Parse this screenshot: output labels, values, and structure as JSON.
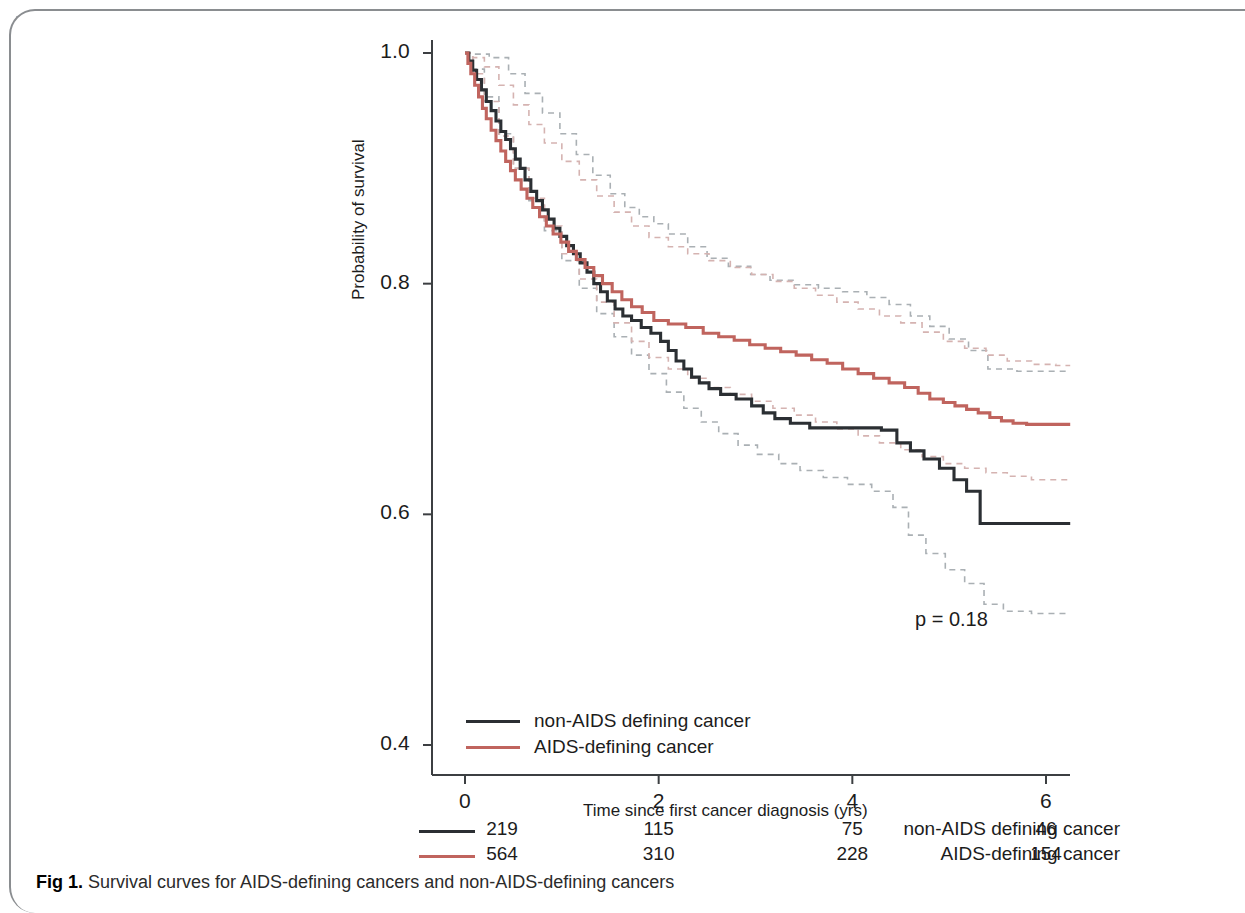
{
  "figure": {
    "caption_prefix": "Fig 1.",
    "caption_text": "Survival curves for AIDS-defining cancers and non-AIDS-defining cancers"
  },
  "annotations": {
    "pvalue": "p = 0.18"
  },
  "legend": {
    "position": "inside-bottom-left",
    "entries": [
      {
        "label": "non-AIDS defining cancer",
        "color": "#2b2f33"
      },
      {
        "label": "AIDS-defining cancer",
        "color": "#c0645e"
      }
    ]
  },
  "risk_table": {
    "time_header": [
      "0",
      "2",
      "4",
      "6"
    ],
    "rows": [
      {
        "label": "non-AIDS defining cancer",
        "color": "#2b2f33",
        "counts": [
          "219",
          "115",
          "75",
          "46"
        ]
      },
      {
        "label": "AIDS-defining cancer",
        "color": "#c0645e",
        "counts": [
          "564",
          "310",
          "228",
          "154"
        ]
      }
    ]
  },
  "chart_data": {
    "type": "line",
    "title": "",
    "xlabel": "Time since first cancer diagnosis (yrs)",
    "ylabel": "Probability of survival",
    "xlim": [
      0,
      6.35
    ],
    "ylim": [
      0.38,
      1.02
    ],
    "xticks": [
      0,
      2,
      4,
      6
    ],
    "xtick_labels": [
      "0",
      "2",
      "4",
      "6"
    ],
    "yticks": [
      0.4,
      0.6,
      0.8,
      1.0
    ],
    "ytick_labels": [
      "0.4",
      "0.6",
      "0.8",
      "1.0"
    ],
    "grid": false,
    "curve_style": "kaplan-meier step",
    "colors": {
      "non_aids": "#2b2f33",
      "aids": "#c0645e",
      "ci_non_aids": "#aab0b4",
      "ci_aids": "#d5b3b1"
    },
    "series": [
      {
        "name": "non-AIDS defining cancer",
        "color": "#2b2f33",
        "style": "solid",
        "points": [
          [
            0.0,
            1.0
          ],
          [
            0.04,
            0.993
          ],
          [
            0.08,
            0.985
          ],
          [
            0.12,
            0.977
          ],
          [
            0.17,
            0.968
          ],
          [
            0.22,
            0.958
          ],
          [
            0.27,
            0.95
          ],
          [
            0.32,
            0.941
          ],
          [
            0.37,
            0.932
          ],
          [
            0.42,
            0.925
          ],
          [
            0.47,
            0.917
          ],
          [
            0.52,
            0.908
          ],
          [
            0.57,
            0.9
          ],
          [
            0.62,
            0.89
          ],
          [
            0.68,
            0.88
          ],
          [
            0.74,
            0.872
          ],
          [
            0.8,
            0.864
          ],
          [
            0.86,
            0.856
          ],
          [
            0.92,
            0.848
          ],
          [
            0.98,
            0.841
          ],
          [
            1.05,
            0.833
          ],
          [
            1.12,
            0.826
          ],
          [
            1.19,
            0.818
          ],
          [
            1.26,
            0.81
          ],
          [
            1.33,
            0.8
          ],
          [
            1.4,
            0.793
          ],
          [
            1.47,
            0.785
          ],
          [
            1.55,
            0.778
          ],
          [
            1.63,
            0.772
          ],
          [
            1.72,
            0.768
          ],
          [
            1.82,
            0.762
          ],
          [
            1.92,
            0.757
          ],
          [
            2.02,
            0.75
          ],
          [
            2.1,
            0.742
          ],
          [
            2.18,
            0.733
          ],
          [
            2.26,
            0.726
          ],
          [
            2.34,
            0.719
          ],
          [
            2.42,
            0.714
          ],
          [
            2.52,
            0.709
          ],
          [
            2.64,
            0.704
          ],
          [
            2.8,
            0.7
          ],
          [
            2.96,
            0.694
          ],
          [
            3.08,
            0.688
          ],
          [
            3.2,
            0.683
          ],
          [
            3.36,
            0.679
          ],
          [
            3.56,
            0.675
          ],
          [
            3.8,
            0.675
          ],
          [
            4.05,
            0.675
          ],
          [
            4.3,
            0.673
          ],
          [
            4.46,
            0.662
          ],
          [
            4.6,
            0.655
          ],
          [
            4.74,
            0.648
          ],
          [
            4.9,
            0.64
          ],
          [
            5.05,
            0.63
          ],
          [
            5.18,
            0.62
          ],
          [
            5.32,
            0.592
          ],
          [
            5.6,
            0.592
          ],
          [
            6.0,
            0.592
          ],
          [
            6.25,
            0.592
          ]
        ]
      },
      {
        "name": "AIDS-defining cancer",
        "color": "#c0645e",
        "style": "solid",
        "points": [
          [
            0.0,
            1.0
          ],
          [
            0.03,
            0.991
          ],
          [
            0.06,
            0.982
          ],
          [
            0.1,
            0.972
          ],
          [
            0.14,
            0.962
          ],
          [
            0.18,
            0.952
          ],
          [
            0.22,
            0.943
          ],
          [
            0.27,
            0.933
          ],
          [
            0.32,
            0.924
          ],
          [
            0.37,
            0.915
          ],
          [
            0.42,
            0.906
          ],
          [
            0.47,
            0.898
          ],
          [
            0.52,
            0.89
          ],
          [
            0.58,
            0.882
          ],
          [
            0.64,
            0.874
          ],
          [
            0.7,
            0.866
          ],
          [
            0.77,
            0.858
          ],
          [
            0.84,
            0.85
          ],
          [
            0.91,
            0.843
          ],
          [
            0.99,
            0.836
          ],
          [
            1.07,
            0.828
          ],
          [
            1.15,
            0.821
          ],
          [
            1.24,
            0.814
          ],
          [
            1.33,
            0.807
          ],
          [
            1.42,
            0.8
          ],
          [
            1.52,
            0.793
          ],
          [
            1.62,
            0.786
          ],
          [
            1.72,
            0.78
          ],
          [
            1.83,
            0.775
          ],
          [
            1.95,
            0.768
          ],
          [
            2.1,
            0.765
          ],
          [
            2.28,
            0.762
          ],
          [
            2.46,
            0.757
          ],
          [
            2.62,
            0.754
          ],
          [
            2.78,
            0.751
          ],
          [
            2.94,
            0.747
          ],
          [
            3.1,
            0.744
          ],
          [
            3.26,
            0.741
          ],
          [
            3.42,
            0.738
          ],
          [
            3.58,
            0.734
          ],
          [
            3.74,
            0.731
          ],
          [
            3.9,
            0.726
          ],
          [
            4.06,
            0.722
          ],
          [
            4.22,
            0.718
          ],
          [
            4.38,
            0.714
          ],
          [
            4.54,
            0.71
          ],
          [
            4.68,
            0.705
          ],
          [
            4.8,
            0.7
          ],
          [
            4.94,
            0.697
          ],
          [
            5.06,
            0.694
          ],
          [
            5.18,
            0.691
          ],
          [
            5.3,
            0.688
          ],
          [
            5.42,
            0.684
          ],
          [
            5.54,
            0.681
          ],
          [
            5.66,
            0.679
          ],
          [
            5.8,
            0.678
          ],
          [
            6.0,
            0.678
          ],
          [
            6.25,
            0.678
          ]
        ]
      },
      {
        "name": "non-AIDS defining cancer upper 95% CI",
        "color": "#aab0b4",
        "style": "dotted",
        "points": [
          [
            0.0,
            1.0
          ],
          [
            0.1,
            0.999
          ],
          [
            0.25,
            0.996
          ],
          [
            0.45,
            0.982
          ],
          [
            0.62,
            0.965
          ],
          [
            0.8,
            0.948
          ],
          [
            0.98,
            0.93
          ],
          [
            1.15,
            0.912
          ],
          [
            1.32,
            0.894
          ],
          [
            1.5,
            0.878
          ],
          [
            1.65,
            0.866
          ],
          [
            1.8,
            0.858
          ],
          [
            1.95,
            0.852
          ],
          [
            2.1,
            0.843
          ],
          [
            2.3,
            0.832
          ],
          [
            2.5,
            0.822
          ],
          [
            2.72,
            0.815
          ],
          [
            2.95,
            0.808
          ],
          [
            3.15,
            0.803
          ],
          [
            3.4,
            0.799
          ],
          [
            3.65,
            0.796
          ],
          [
            3.9,
            0.793
          ],
          [
            4.15,
            0.788
          ],
          [
            4.38,
            0.782
          ],
          [
            4.6,
            0.772
          ],
          [
            4.8,
            0.763
          ],
          [
            5.0,
            0.752
          ],
          [
            5.2,
            0.742
          ],
          [
            5.4,
            0.726
          ],
          [
            5.7,
            0.724
          ],
          [
            6.0,
            0.724
          ],
          [
            6.25,
            0.724
          ]
        ]
      },
      {
        "name": "non-AIDS defining cancer lower 95% CI",
        "color": "#aab0b4",
        "style": "dotted",
        "points": [
          [
            0.0,
            1.0
          ],
          [
            0.08,
            0.986
          ],
          [
            0.2,
            0.962
          ],
          [
            0.35,
            0.93
          ],
          [
            0.5,
            0.9
          ],
          [
            0.66,
            0.872
          ],
          [
            0.82,
            0.846
          ],
          [
            1.0,
            0.82
          ],
          [
            1.18,
            0.796
          ],
          [
            1.36,
            0.774
          ],
          [
            1.54,
            0.754
          ],
          [
            1.72,
            0.738
          ],
          [
            1.9,
            0.722
          ],
          [
            2.08,
            0.706
          ],
          [
            2.26,
            0.692
          ],
          [
            2.44,
            0.68
          ],
          [
            2.62,
            0.67
          ],
          [
            2.82,
            0.66
          ],
          [
            3.02,
            0.652
          ],
          [
            3.24,
            0.644
          ],
          [
            3.46,
            0.638
          ],
          [
            3.7,
            0.632
          ],
          [
            3.95,
            0.626
          ],
          [
            4.2,
            0.62
          ],
          [
            4.42,
            0.606
          ],
          [
            4.58,
            0.582
          ],
          [
            4.76,
            0.566
          ],
          [
            4.96,
            0.552
          ],
          [
            5.16,
            0.54
          ],
          [
            5.36,
            0.522
          ],
          [
            5.56,
            0.516
          ],
          [
            5.85,
            0.514
          ],
          [
            6.15,
            0.514
          ],
          [
            6.25,
            0.514
          ]
        ]
      },
      {
        "name": "AIDS-defining cancer upper 95% CI",
        "color": "#d5b3b1",
        "style": "dotted",
        "points": [
          [
            0.0,
            1.0
          ],
          [
            0.08,
            0.996
          ],
          [
            0.2,
            0.988
          ],
          [
            0.35,
            0.972
          ],
          [
            0.5,
            0.955
          ],
          [
            0.66,
            0.938
          ],
          [
            0.82,
            0.922
          ],
          [
            1.0,
            0.906
          ],
          [
            1.18,
            0.89
          ],
          [
            1.36,
            0.876
          ],
          [
            1.54,
            0.862
          ],
          [
            1.72,
            0.85
          ],
          [
            1.9,
            0.84
          ],
          [
            2.1,
            0.832
          ],
          [
            2.3,
            0.826
          ],
          [
            2.52,
            0.82
          ],
          [
            2.74,
            0.814
          ],
          [
            2.96,
            0.808
          ],
          [
            3.18,
            0.802
          ],
          [
            3.4,
            0.796
          ],
          [
            3.62,
            0.79
          ],
          [
            3.84,
            0.784
          ],
          [
            4.06,
            0.778
          ],
          [
            4.28,
            0.772
          ],
          [
            4.5,
            0.766
          ],
          [
            4.72,
            0.758
          ],
          [
            4.94,
            0.75
          ],
          [
            5.16,
            0.744
          ],
          [
            5.38,
            0.738
          ],
          [
            5.6,
            0.733
          ],
          [
            5.85,
            0.73
          ],
          [
            6.1,
            0.729
          ],
          [
            6.25,
            0.729
          ]
        ]
      },
      {
        "name": "AIDS-defining cancer lower 95% CI",
        "color": "#d5b3b1",
        "style": "dotted",
        "points": [
          [
            0.0,
            1.0
          ],
          [
            0.08,
            0.982
          ],
          [
            0.2,
            0.958
          ],
          [
            0.35,
            0.928
          ],
          [
            0.5,
            0.9
          ],
          [
            0.66,
            0.874
          ],
          [
            0.82,
            0.85
          ],
          [
            1.0,
            0.826
          ],
          [
            1.18,
            0.804
          ],
          [
            1.36,
            0.784
          ],
          [
            1.54,
            0.766
          ],
          [
            1.72,
            0.75
          ],
          [
            1.9,
            0.736
          ],
          [
            2.1,
            0.726
          ],
          [
            2.3,
            0.718
          ],
          [
            2.52,
            0.71
          ],
          [
            2.74,
            0.704
          ],
          [
            2.96,
            0.698
          ],
          [
            3.18,
            0.692
          ],
          [
            3.4,
            0.686
          ],
          [
            3.62,
            0.68
          ],
          [
            3.84,
            0.674
          ],
          [
            4.06,
            0.668
          ],
          [
            4.28,
            0.662
          ],
          [
            4.5,
            0.656
          ],
          [
            4.72,
            0.65
          ],
          [
            4.94,
            0.644
          ],
          [
            5.16,
            0.64
          ],
          [
            5.38,
            0.636
          ],
          [
            5.6,
            0.633
          ],
          [
            5.85,
            0.63
          ],
          [
            6.1,
            0.63
          ],
          [
            6.25,
            0.63
          ]
        ]
      }
    ]
  }
}
